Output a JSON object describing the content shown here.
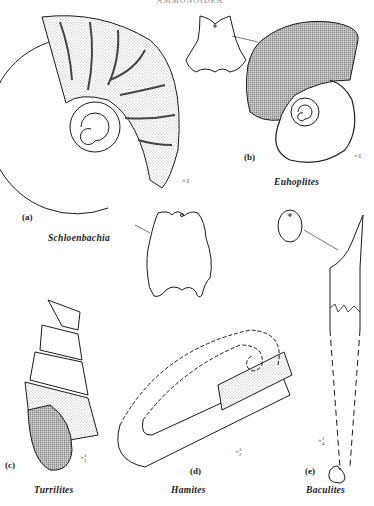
{
  "header": {
    "text": "AMMONOIDEA"
  },
  "figure": {
    "panels": [
      {
        "id": "a",
        "label": "(a)",
        "genus": "Schloenbachia",
        "scale": "×1"
      },
      {
        "id": "b",
        "label": "(b)",
        "genus": "Euhoplites",
        "scale": "×1"
      },
      {
        "id": "c",
        "label": "(c)",
        "genus": "Turrilites",
        "scale": "×",
        "scale_frac_num": "1",
        "scale_frac_den": "2"
      },
      {
        "id": "d",
        "label": "(d)",
        "genus": "Hamites",
        "scale": "×",
        "scale_frac_num": "1",
        "scale_frac_den": "2"
      },
      {
        "id": "e",
        "label": "(e)",
        "genus": "Baculites",
        "scale": "×",
        "scale_frac_num": "1",
        "scale_frac_den": "4"
      }
    ]
  },
  "colors": {
    "ink": "#1a1a1a",
    "paper": "#ffffff",
    "stipple": "#555555"
  }
}
